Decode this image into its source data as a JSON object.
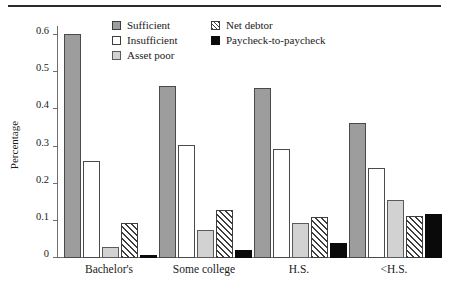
{
  "chart_data": {
    "type": "bar",
    "title": "",
    "subtitle": "",
    "xlabel": "",
    "ylabel": "Percentage",
    "ylim": [
      0,
      0.63
    ],
    "yticks": [
      "0",
      "0.1",
      "0.2",
      "0.3",
      "0.4",
      "0.5",
      "0.6"
    ],
    "ytick_values": [
      0,
      0.1,
      0.2,
      0.3,
      0.4,
      0.5,
      0.6
    ],
    "grid": false,
    "legend_position": "top-center",
    "categories": [
      "Bachelor's",
      "Some college",
      "H.S.",
      "<H.S."
    ],
    "series": [
      {
        "name": "Sufficient",
        "pattern": "solid-dark-gray",
        "color": "#9d9d9d",
        "values": [
          0.607,
          0.468,
          0.462,
          0.366
        ]
      },
      {
        "name": "Insufficient",
        "pattern": "solid-white",
        "color": "#ffffff",
        "values": [
          0.263,
          0.306,
          0.296,
          0.245
        ]
      },
      {
        "name": "Asset poor",
        "pattern": "solid-light-gray",
        "color": "#d2d2d2",
        "values": [
          0.029,
          0.075,
          0.094,
          0.157
        ]
      },
      {
        "name": "Net debtor",
        "pattern": "diagonal-hatch",
        "color": "#3d3d3d",
        "values": [
          0.095,
          0.131,
          0.111,
          0.114
        ]
      },
      {
        "name": "Paycheck-to-paycheck",
        "pattern": "solid-black",
        "color": "#0a0a0a",
        "values": [
          0.007,
          0.022,
          0.042,
          0.12
        ]
      }
    ]
  },
  "legend": {
    "items": [
      {
        "label": "Sufficient",
        "swatch": "sufficient"
      },
      {
        "label": "Insufficient",
        "swatch": "insufficient"
      },
      {
        "label": "Asset poor",
        "swatch": "assetpoor"
      },
      {
        "label": "Net debtor",
        "swatch": "netdebtor"
      },
      {
        "label": "Paycheck-to-paycheck",
        "swatch": "paycheck"
      }
    ]
  },
  "axes": {
    "y_title": "Percentage",
    "y_tick_labels": [
      "0.6",
      "0.5",
      "0.4",
      "0.3",
      "0.2",
      "0.1",
      "0"
    ],
    "x_tick_labels": [
      "Bachelor's",
      "Some college",
      "H.S.",
      "<H.S."
    ]
  }
}
